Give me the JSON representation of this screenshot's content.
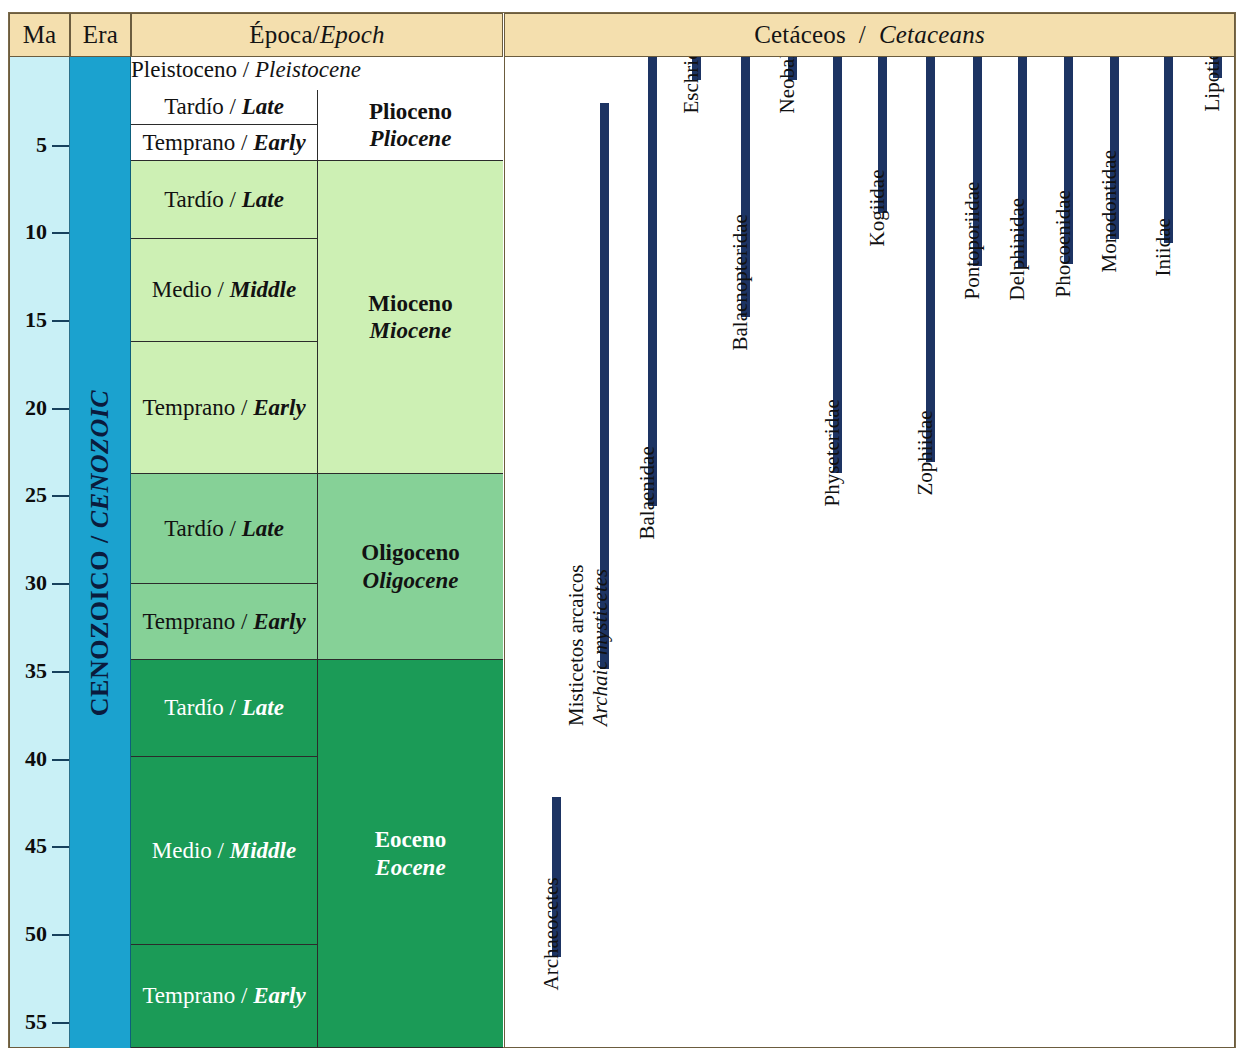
{
  "header": {
    "ma": "Ma",
    "era": "Era",
    "epoch_es": "Época",
    "epoch_sep": " / ",
    "epoch_en": "Epoch",
    "cet_es": "Cetáceos",
    "cet_sep": "  /  ",
    "cet_en": "Cetaceans"
  },
  "axis": {
    "unit": "Ma",
    "min": 0,
    "max": 56.5,
    "ticks": [
      5,
      10,
      15,
      20,
      25,
      30,
      35,
      40,
      45,
      50,
      55
    ],
    "tick_labels": [
      "5",
      "10",
      "15",
      "20",
      "25",
      "30",
      "35",
      "40",
      "45",
      "50",
      "55"
    ]
  },
  "era": {
    "label_es": "CENOZOICO",
    "sep": " / ",
    "label_en": "CENOZOIC",
    "color": "#1ba2cf"
  },
  "epochs": [
    {
      "name_es": "Pleistoceno",
      "name_en": "Pleistocene",
      "color": "#ffffff",
      "top": 0,
      "bottom": 33
    },
    {
      "name_es": "Plioceno",
      "name_en": "Pliocene",
      "color": "#ffffff",
      "top": 33,
      "bottom": 104
    },
    {
      "name_es": "Mioceno",
      "name_en": "Miocene",
      "color": "#cdf0b4",
      "top": 104,
      "bottom": 417
    },
    {
      "name_es": "Oligoceno",
      "name_en": "Oligocene",
      "color": "#86d197",
      "top": 417,
      "bottom": 603
    },
    {
      "name_es": "Eoceno",
      "name_en": "Eocene",
      "color": "#1b9b57",
      "top": 603,
      "bottom": 991
    }
  ],
  "subepochs": [
    {
      "name_es": "Pleistoceno",
      "name_en": "Pleistocene",
      "color": "#ffffff",
      "span": "full",
      "top": 0,
      "bottom": 33,
      "white_text": false
    },
    {
      "name_es": "Tardío",
      "name_en": "Late",
      "color": "#ffffff",
      "span": "left",
      "top": 33,
      "bottom": 68,
      "white_text": false
    },
    {
      "name_es": "Temprano",
      "name_en": "Early",
      "color": "#ffffff",
      "span": "left",
      "top": 68,
      "bottom": 104,
      "white_text": false
    },
    {
      "name_es": "Tardío",
      "name_en": "Late",
      "color": "#cdf0b4",
      "span": "left",
      "top": 104,
      "bottom": 182,
      "white_text": false
    },
    {
      "name_es": "Medio",
      "name_en": "Middle",
      "color": "#cdf0b4",
      "span": "left",
      "top": 182,
      "bottom": 285,
      "white_text": false
    },
    {
      "name_es": "Temprano",
      "name_en": "Early",
      "color": "#cdf0b4",
      "span": "left",
      "top": 285,
      "bottom": 417,
      "white_text": false
    },
    {
      "name_es": "Tardío",
      "name_en": "Late",
      "color": "#86d197",
      "span": "left",
      "top": 417,
      "bottom": 527,
      "white_text": false
    },
    {
      "name_es": "Temprano",
      "name_en": "Early",
      "color": "#86d197",
      "span": "left",
      "top": 527,
      "bottom": 603,
      "white_text": false
    },
    {
      "name_es": "Tardío",
      "name_en": "Late",
      "color": "#1b9b57",
      "span": "left",
      "top": 603,
      "bottom": 700,
      "white_text": true
    },
    {
      "name_es": "Medio",
      "name_en": "Middle",
      "color": "#1b9b57",
      "span": "left",
      "top": 700,
      "bottom": 888,
      "white_text": true
    },
    {
      "name_es": "Temprano",
      "name_en": "Early",
      "color": "#1b9b57",
      "span": "left",
      "top": 888,
      "bottom": 991,
      "white_text": true
    }
  ],
  "chart_data": {
    "type": "range-bar",
    "title": "Cetáceos / Cetaceans",
    "ylabel": "Ma",
    "ylim": [
      0,
      56.5
    ],
    "grid": false,
    "legend": null,
    "bar_color": "#1d3463",
    "taxa": [
      {
        "label_es": "Archaeocetes",
        "label_en": "",
        "x": 47,
        "start_ma": 42.2,
        "end_ma": 51.3
      },
      {
        "label_es": "Misticetos arcaicos",
        "label_en": "Archaic mysticetes",
        "x": 95,
        "start_ma": 2.6,
        "end_ma": 34.9
      },
      {
        "label_es": "Balaenidae",
        "label_en": "",
        "x": 143,
        "start_ma": 0.0,
        "end_ma": 25.6
      },
      {
        "label_es": "Eschrichtiidae",
        "label_en": "",
        "x": 187,
        "start_ma": 0.0,
        "end_ma": 1.3
      },
      {
        "label_es": "Balaenopteridae",
        "label_en": "",
        "x": 236,
        "start_ma": 0.0,
        "end_ma": 14.8
      },
      {
        "label_es": "Neobalaenidae",
        "label_en": "",
        "x": 283,
        "start_ma": 0.0,
        "end_ma": 1.3
      },
      {
        "label_es": "Physeteridae",
        "label_en": "",
        "x": 328,
        "start_ma": 0.0,
        "end_ma": 23.7
      },
      {
        "label_es": "Kogiidae",
        "label_en": "",
        "x": 373,
        "start_ma": 0.0,
        "end_ma": 8.9
      },
      {
        "label_es": "Zophiidae",
        "label_en": "",
        "x": 421,
        "start_ma": 0.0,
        "end_ma": 23.1
      },
      {
        "label_es": "Pontoporiidae",
        "label_en": "",
        "x": 468,
        "start_ma": 0.0,
        "end_ma": 11.9
      },
      {
        "label_es": "Delphinidae",
        "label_en": "",
        "x": 513,
        "start_ma": 0.0,
        "end_ma": 12.0
      },
      {
        "label_es": "Phocoenidae",
        "label_en": "",
        "x": 559,
        "start_ma": 0.0,
        "end_ma": 11.8
      },
      {
        "label_es": "Monodontidae",
        "label_en": "",
        "x": 605,
        "start_ma": 0.0,
        "end_ma": 10.4
      },
      {
        "label_es": "Iniidae",
        "label_en": "",
        "x": 659,
        "start_ma": 0.0,
        "end_ma": 10.6
      },
      {
        "label_es": "Lipotidae",
        "label_en": "",
        "x": 708,
        "start_ma": 0.0,
        "end_ma": 1.2
      }
    ]
  }
}
